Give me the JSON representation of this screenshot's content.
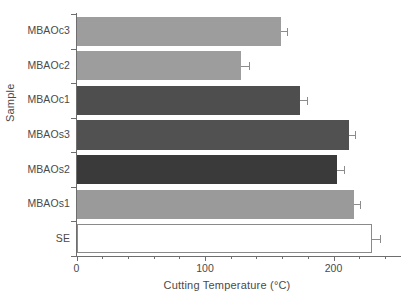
{
  "chart_data": {
    "type": "bar",
    "orientation": "horizontal",
    "title": "",
    "xlabel": "Cutting Temperature (°C)",
    "ylabel": "Sample",
    "categories": [
      "SE",
      "MBAOs1",
      "MBAOs2",
      "MBAOs3",
      "MBAOc1",
      "MBAOc2",
      "MBAOc3"
    ],
    "values": [
      230,
      216,
      203,
      212,
      174,
      128,
      159
    ],
    "errors": [
      6,
      5,
      5,
      5,
      5,
      6,
      5
    ],
    "bar_colors": [
      "#ffffff",
      "#9a9a9a",
      "#3a3a3a",
      "#515151",
      "#4e4e4e",
      "#9d9d9d",
      "#9d9d9d"
    ],
    "xlim": [
      0,
      250
    ],
    "xticks_major": [
      0,
      100,
      200
    ],
    "xtick_labels": [
      "0",
      "100",
      "200"
    ],
    "xticks_minor_step": 20,
    "grid": false,
    "legend": false,
    "axis_color": "#6e6e6e",
    "error_bar_color": "#8c8c8c"
  },
  "axes": {
    "x_title": "Cutting Temperature (°C)",
    "y_title": "Sample"
  },
  "categories_display": [
    {
      "label": "MBAOc3"
    },
    {
      "label": "MBAOc2"
    },
    {
      "label": "MBAOc1"
    },
    {
      "label": "MBAOs3"
    },
    {
      "label": "MBAOs2"
    },
    {
      "label": "MBAOs1"
    },
    {
      "label": "SE"
    }
  ],
  "xtick_labels": [
    {
      "label": "0"
    },
    {
      "label": "100"
    },
    {
      "label": "200"
    }
  ]
}
